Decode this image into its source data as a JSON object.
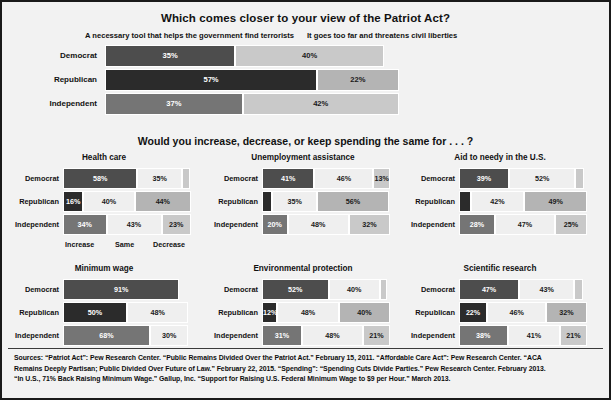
{
  "section1": {
    "title": "Which comes closer to your view of the Patriot Act?",
    "legend_left": "A necessary tool that helps the government find terrorists",
    "legend_right": "It goes too far and threatens civil liberties",
    "rows": [
      {
        "label": "Democrat",
        "left_value": 35,
        "left_label": "35%",
        "right_value": 40,
        "right_label": "40%"
      },
      {
        "label": "Republican",
        "left_value": 57,
        "left_label": "57%",
        "right_value": 22,
        "right_label": "22%"
      },
      {
        "label": "Independent",
        "left_value": 37,
        "left_label": "37%",
        "right_value": 42,
        "right_label": "42%"
      }
    ]
  },
  "section2": {
    "title": "Would you increase, decrease, or keep spending the same for . . . ?",
    "axis": [
      "Increase",
      "Same",
      "Decrease"
    ],
    "row_labels": [
      "Democrat",
      "Republican",
      "Independent"
    ],
    "panels": [
      {
        "title": "Health care",
        "rows": [
          {
            "label": "Democrat",
            "values": [
              58,
              35,
              6
            ],
            "labels": [
              "58%",
              "35%",
              ""
            ]
          },
          {
            "label": "Republican",
            "values": [
              16,
              40,
              44
            ],
            "labels": [
              "16%",
              "40%",
              "44%"
            ]
          },
          {
            "label": "Independent",
            "values": [
              34,
              43,
              23
            ],
            "labels": [
              "34%",
              "43%",
              "23%"
            ]
          }
        ]
      },
      {
        "title": "Unemployment assistance",
        "rows": [
          {
            "label": "Democrat",
            "values": [
              41,
              46,
              13
            ],
            "labels": [
              "41%",
              "46%",
              "13%"
            ]
          },
          {
            "label": "Republican",
            "values": [
              8,
              35,
              56
            ],
            "labels": [
              "",
              "35%",
              "56%"
            ]
          },
          {
            "label": "Independent",
            "values": [
              20,
              48,
              32
            ],
            "labels": [
              "20%",
              "48%",
              "32%"
            ]
          }
        ]
      },
      {
        "title": "Aid to needy in the U.S.",
        "rows": [
          {
            "label": "Democrat",
            "values": [
              39,
              52,
              7
            ],
            "labels": [
              "39%",
              "52%",
              ""
            ]
          },
          {
            "label": "Republican",
            "values": [
              9,
              42,
              49
            ],
            "labels": [
              "",
              "42%",
              "49%"
            ]
          },
          {
            "label": "Independent",
            "values": [
              28,
              47,
              25
            ],
            "labels": [
              "28%",
              "47%",
              "25%"
            ]
          }
        ]
      },
      {
        "title": "Minimum wage",
        "rows": [
          {
            "label": "Democrat",
            "values": [
              91,
              0,
              0
            ],
            "labels": [
              "91%",
              "",
              ""
            ]
          },
          {
            "label": "Republican",
            "values": [
              50,
              48,
              0
            ],
            "labels": [
              "50%",
              "48%",
              ""
            ]
          },
          {
            "label": "Independent",
            "values": [
              68,
              30,
              0
            ],
            "labels": [
              "68%",
              "30%",
              ""
            ]
          }
        ]
      },
      {
        "title": "Environmental protection",
        "rows": [
          {
            "label": "Democrat",
            "values": [
              52,
              40,
              6
            ],
            "labels": [
              "52%",
              "40%",
              ""
            ]
          },
          {
            "label": "Republican",
            "values": [
              12,
              48,
              40
            ],
            "labels": [
              "12%",
              "48%",
              "40%"
            ]
          },
          {
            "label": "Independent",
            "values": [
              31,
              48,
              21
            ],
            "labels": [
              "31%",
              "48%",
              "21%"
            ]
          }
        ]
      },
      {
        "title": "Scientific research",
        "rows": [
          {
            "label": "Democrat",
            "values": [
              47,
              43,
              7
            ],
            "labels": [
              "47%",
              "43%",
              ""
            ]
          },
          {
            "label": "Republican",
            "values": [
              22,
              46,
              32
            ],
            "labels": [
              "22%",
              "46%",
              "32%"
            ]
          },
          {
            "label": "Independent",
            "values": [
              38,
              41,
              21
            ],
            "labels": [
              "38%",
              "41%",
              "21%"
            ]
          }
        ]
      }
    ]
  },
  "sources": {
    "line1": "Sources: “Patriot Act”: Pew Research Center. “Public Remains Divided Over the Patriot Act.” February 15, 2011. “Affordable Care Act”: Pew Research Center. “ACA",
    "line2": "Remains Deeply Partisan; Public Divided Over Future of Law.” February 22, 2015. “Spending”: “Spending Cuts Divide Parties.” Pew Research Center. February 2013.",
    "line3": "“In U.S., 71% Back Raising Minimum Wage.” Gallup, Inc. “Support for Raising U.S. Federal Minimum Wage to $9 per Hour.” March 2013."
  },
  "chart_data": [
    {
      "type": "bar",
      "title": "Which comes closer to your view of the Patriot Act?",
      "orientation": "horizontal",
      "stacked": true,
      "categories": [
        "Democrat",
        "Republican",
        "Independent"
      ],
      "series": [
        {
          "name": "A necessary tool that helps the government find terrorists",
          "values": [
            35,
            57,
            37
          ]
        },
        {
          "name": "It goes too far and threatens civil liberties",
          "values": [
            40,
            22,
            42
          ]
        }
      ],
      "xlabel": "",
      "ylabel": "",
      "xlim": [
        0,
        100
      ],
      "grid": false,
      "legend": "top"
    },
    {
      "type": "bar",
      "title": "Health care",
      "group_title": "Would you increase, decrease, or keep spending the same for . . . ?",
      "orientation": "horizontal",
      "stacked": true,
      "categories": [
        "Democrat",
        "Republican",
        "Independent"
      ],
      "series": [
        {
          "name": "Increase",
          "values": [
            58,
            16,
            34
          ]
        },
        {
          "name": "Same",
          "values": [
            35,
            40,
            43
          ]
        },
        {
          "name": "Decrease",
          "values": [
            6,
            44,
            23
          ]
        }
      ],
      "xlim": [
        0,
        100
      ],
      "grid": false
    },
    {
      "type": "bar",
      "title": "Unemployment assistance",
      "orientation": "horizontal",
      "stacked": true,
      "categories": [
        "Democrat",
        "Republican",
        "Independent"
      ],
      "series": [
        {
          "name": "Increase",
          "values": [
            41,
            8,
            20
          ]
        },
        {
          "name": "Same",
          "values": [
            46,
            35,
            48
          ]
        },
        {
          "name": "Decrease",
          "values": [
            13,
            56,
            32
          ]
        }
      ],
      "xlim": [
        0,
        100
      ],
      "grid": false
    },
    {
      "type": "bar",
      "title": "Aid to needy in the U.S.",
      "orientation": "horizontal",
      "stacked": true,
      "categories": [
        "Democrat",
        "Republican",
        "Independent"
      ],
      "series": [
        {
          "name": "Increase",
          "values": [
            39,
            9,
            28
          ]
        },
        {
          "name": "Same",
          "values": [
            52,
            42,
            47
          ]
        },
        {
          "name": "Decrease",
          "values": [
            7,
            49,
            25
          ]
        }
      ],
      "xlim": [
        0,
        100
      ],
      "grid": false
    },
    {
      "type": "bar",
      "title": "Minimum wage",
      "orientation": "horizontal",
      "stacked": true,
      "categories": [
        "Democrat",
        "Republican",
        "Independent"
      ],
      "series": [
        {
          "name": "Increase",
          "values": [
            91,
            50,
            68
          ]
        },
        {
          "name": "Same",
          "values": [
            0,
            48,
            30
          ]
        },
        {
          "name": "Decrease",
          "values": [
            0,
            0,
            0
          ]
        }
      ],
      "xlim": [
        0,
        100
      ],
      "grid": false
    },
    {
      "type": "bar",
      "title": "Environmental protection",
      "orientation": "horizontal",
      "stacked": true,
      "categories": [
        "Democrat",
        "Republican",
        "Independent"
      ],
      "series": [
        {
          "name": "Increase",
          "values": [
            52,
            12,
            31
          ]
        },
        {
          "name": "Same",
          "values": [
            40,
            48,
            48
          ]
        },
        {
          "name": "Decrease",
          "values": [
            6,
            40,
            21
          ]
        }
      ],
      "xlim": [
        0,
        100
      ],
      "grid": false
    },
    {
      "type": "bar",
      "title": "Scientific research",
      "orientation": "horizontal",
      "stacked": true,
      "categories": [
        "Democrat",
        "Republican",
        "Independent"
      ],
      "series": [
        {
          "name": "Increase",
          "values": [
            47,
            22,
            38
          ]
        },
        {
          "name": "Same",
          "values": [
            43,
            46,
            41
          ]
        },
        {
          "name": "Decrease",
          "values": [
            7,
            32,
            21
          ]
        }
      ],
      "xlim": [
        0,
        100
      ],
      "grid": false
    }
  ]
}
